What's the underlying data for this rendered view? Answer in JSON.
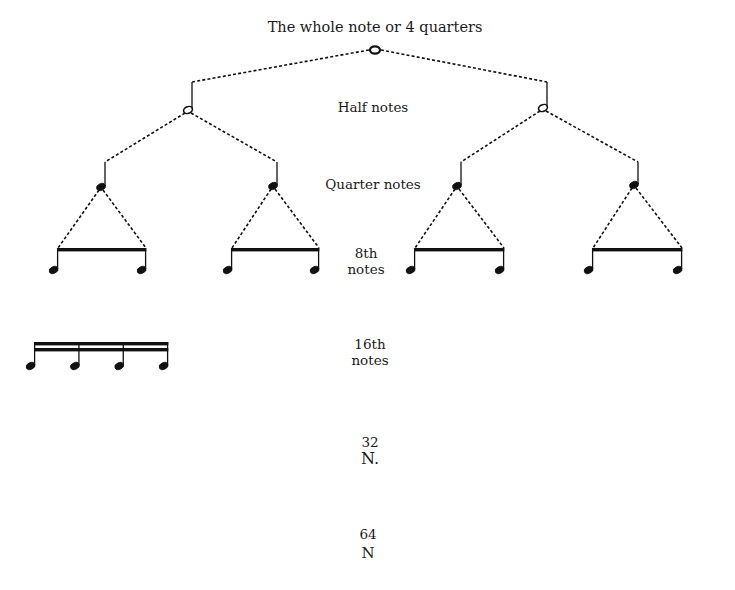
{
  "title": "The whole note or 4 quarters",
  "labels": {
    "half": "Half notes",
    "quarter": "Quarter notes",
    "eighth_line1": "8th",
    "eighth_line2": "notes",
    "sixteenth_line1": "16th",
    "sixteenth_line2": "notes",
    "thirtysecond_line1": "32",
    "thirtysecond_line2": "N.",
    "sixtyfourth_line1": "64",
    "sixtyfourth_line2": "N"
  },
  "colors": {
    "ink": "#111111",
    "paper": "#ffffff"
  },
  "tree": {
    "whole": {
      "x": 375,
      "y": 50
    },
    "half": [
      {
        "x": 188,
        "y": 110,
        "stemTop": 82
      },
      {
        "x": 543,
        "y": 108,
        "stemTop": 82
      }
    ],
    "quarter": [
      {
        "x": 101,
        "y": 187,
        "stemTop": 162
      },
      {
        "x": 273,
        "y": 186,
        "stemTop": 162
      },
      {
        "x": 457,
        "y": 186,
        "stemTop": 162
      },
      {
        "x": 634,
        "y": 185,
        "stemTop": 162
      }
    ],
    "eighth": {
      "beamY": 248,
      "headY": 270,
      "beams": 1,
      "groups": [
        [
          57,
          145
        ],
        [
          231,
          318
        ],
        [
          414,
          503
        ],
        [
          592,
          681
        ]
      ]
    },
    "sixteenth": {
      "beamY": 342,
      "headY": 366,
      "beams": 2,
      "groups": [
        [
          34,
          167
        ],
        [
          211,
          342
        ],
        [
          394,
          526
        ],
        [
          570,
          704
        ]
      ]
    },
    "thirtysecond": {
      "beamY": 443,
      "headY": 473,
      "beams": 3,
      "groups": [
        [
          25,
          90
        ],
        [
          112,
          179
        ],
        [
          202,
          267
        ],
        [
          289,
          354
        ],
        [
          387,
          452
        ],
        [
          474,
          539
        ],
        [
          562,
          627
        ],
        [
          650,
          716
        ]
      ]
    },
    "sixtyfourth": {
      "beamY": 537,
      "headY": 572,
      "beams": 4,
      "groups": [
        [
          18,
          51
        ],
        [
          63,
          96
        ],
        [
          106,
          138
        ],
        [
          149,
          181
        ],
        [
          191,
          224
        ],
        [
          235,
          268
        ],
        [
          277,
          309
        ],
        [
          320,
          352
        ],
        [
          381,
          414
        ],
        [
          423,
          457
        ],
        [
          466,
          499
        ],
        [
          509,
          542
        ],
        [
          553,
          586
        ],
        [
          596,
          629
        ],
        [
          639,
          672
        ],
        [
          682,
          714
        ]
      ]
    }
  }
}
